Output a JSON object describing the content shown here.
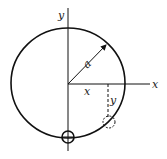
{
  "labels": {
    "y_axis": "y",
    "x_axis": "x",
    "radius": "a",
    "x_coord": "x",
    "y_coord": "y"
  },
  "colors": {
    "stroke": "#111111",
    "background": "#ffffff"
  }
}
